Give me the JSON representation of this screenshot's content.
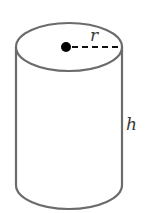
{
  "diagram": {
    "type": "cylinder",
    "colors": {
      "stroke": "#6b6b6b",
      "dot": "#000000",
      "label": "#3a3a3a",
      "background": "#ffffff"
    },
    "labels": {
      "radius": "r",
      "height": "h"
    },
    "geometry": {
      "top_ellipse": {
        "cx": 69,
        "cy": 47,
        "rx": 53,
        "ry": 24
      },
      "bottom_y": 185,
      "center_dot": {
        "cx": 66,
        "cy": 47,
        "r": 5
      },
      "radius_line": {
        "x1": 72,
        "y1": 47,
        "x2": 122,
        "y2": 47,
        "dashed": true
      },
      "radius_label_pos": {
        "x": 92,
        "y": 40
      },
      "height_label_pos": {
        "x": 126,
        "y": 128
      }
    }
  }
}
